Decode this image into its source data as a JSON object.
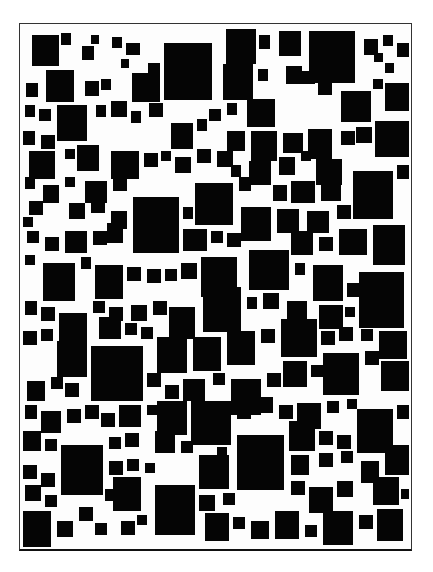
{
  "artwork": {
    "description": "Abstract composition of black squares of varying sizes packed inside a white rectangular frame",
    "background_color": "#ffffff",
    "square_color": "#050505",
    "frame": {
      "x": 19,
      "y": 23,
      "width": 393,
      "height": 528,
      "border_color": "#333333"
    },
    "squares": [
      [
        31,
        34,
        27,
        31
      ],
      [
        60,
        32,
        10,
        12
      ],
      [
        81,
        45,
        12,
        14
      ],
      [
        90,
        34,
        8,
        9
      ],
      [
        111,
        36,
        10,
        11
      ],
      [
        120,
        58,
        8,
        9
      ],
      [
        125,
        42,
        14,
        12
      ],
      [
        163,
        42,
        48,
        57
      ],
      [
        225,
        28,
        30,
        35
      ],
      [
        222,
        63,
        30,
        36
      ],
      [
        258,
        34,
        11,
        14
      ],
      [
        278,
        30,
        22,
        25
      ],
      [
        285,
        65,
        16,
        18
      ],
      [
        257,
        68,
        10,
        12
      ],
      [
        308,
        30,
        46,
        52
      ],
      [
        363,
        38,
        14,
        16
      ],
      [
        373,
        52,
        9,
        9
      ],
      [
        382,
        34,
        10,
        11
      ],
      [
        396,
        42,
        12,
        14
      ],
      [
        384,
        62,
        9,
        10
      ],
      [
        45,
        69,
        28,
        32
      ],
      [
        25,
        82,
        12,
        14
      ],
      [
        84,
        80,
        14,
        15
      ],
      [
        100,
        78,
        10,
        11
      ],
      [
        131,
        72,
        28,
        29
      ],
      [
        147,
        62,
        12,
        12
      ],
      [
        246,
        98,
        28,
        28
      ],
      [
        226,
        102,
        10,
        12
      ],
      [
        300,
        70,
        14,
        13
      ],
      [
        317,
        82,
        14,
        12
      ],
      [
        340,
        90,
        30,
        31
      ],
      [
        372,
        78,
        10,
        10
      ],
      [
        384,
        82,
        24,
        28
      ],
      [
        24,
        104,
        10,
        12
      ],
      [
        38,
        108,
        12,
        12
      ],
      [
        56,
        104,
        30,
        36
      ],
      [
        95,
        104,
        10,
        12
      ],
      [
        110,
        100,
        16,
        16
      ],
      [
        130,
        110,
        10,
        12
      ],
      [
        148,
        102,
        14,
        14
      ],
      [
        170,
        122,
        22,
        26
      ],
      [
        196,
        118,
        10,
        12
      ],
      [
        208,
        108,
        12,
        12
      ],
      [
        226,
        130,
        18,
        20
      ],
      [
        250,
        130,
        26,
        30
      ],
      [
        282,
        132,
        20,
        20
      ],
      [
        307,
        128,
        24,
        30
      ],
      [
        340,
        130,
        14,
        14
      ],
      [
        355,
        126,
        16,
        16
      ],
      [
        374,
        120,
        34,
        36
      ],
      [
        22,
        130,
        12,
        14
      ],
      [
        40,
        134,
        14,
        14
      ],
      [
        28,
        150,
        26,
        28
      ],
      [
        64,
        148,
        10,
        10
      ],
      [
        76,
        144,
        22,
        26
      ],
      [
        110,
        150,
        28,
        28
      ],
      [
        143,
        152,
        14,
        14
      ],
      [
        160,
        150,
        10,
        10
      ],
      [
        174,
        156,
        16,
        16
      ],
      [
        196,
        148,
        14,
        14
      ],
      [
        216,
        150,
        16,
        16
      ],
      [
        230,
        164,
        10,
        12
      ],
      [
        248,
        160,
        22,
        24
      ],
      [
        278,
        156,
        16,
        18
      ],
      [
        300,
        150,
        10,
        10
      ],
      [
        315,
        158,
        26,
        26
      ],
      [
        352,
        170,
        40,
        48
      ],
      [
        396,
        164,
        12,
        14
      ],
      [
        24,
        176,
        10,
        12
      ],
      [
        42,
        184,
        16,
        18
      ],
      [
        64,
        176,
        10,
        10
      ],
      [
        84,
        180,
        22,
        22
      ],
      [
        112,
        178,
        14,
        12
      ],
      [
        194,
        182,
        38,
        42
      ],
      [
        238,
        176,
        12,
        14
      ],
      [
        272,
        184,
        14,
        16
      ],
      [
        290,
        180,
        24,
        22
      ],
      [
        320,
        178,
        20,
        22
      ],
      [
        28,
        200,
        14,
        14
      ],
      [
        68,
        202,
        16,
        16
      ],
      [
        90,
        198,
        14,
        14
      ],
      [
        110,
        210,
        16,
        18
      ],
      [
        132,
        196,
        46,
        56
      ],
      [
        182,
        206,
        10,
        12
      ],
      [
        240,
        206,
        30,
        34
      ],
      [
        276,
        208,
        22,
        24
      ],
      [
        306,
        210,
        22,
        22
      ],
      [
        336,
        204,
        14,
        14
      ],
      [
        372,
        224,
        32,
        40
      ],
      [
        22,
        216,
        10,
        10
      ],
      [
        26,
        230,
        12,
        12
      ],
      [
        44,
        236,
        14,
        14
      ],
      [
        64,
        230,
        22,
        22
      ],
      [
        92,
        230,
        14,
        14
      ],
      [
        106,
        222,
        16,
        20
      ],
      [
        182,
        228,
        24,
        22
      ],
      [
        210,
        230,
        12,
        12
      ],
      [
        226,
        232,
        14,
        14
      ],
      [
        290,
        230,
        22,
        24
      ],
      [
        318,
        236,
        14,
        14
      ],
      [
        338,
        228,
        28,
        26
      ],
      [
        24,
        254,
        10,
        10
      ],
      [
        42,
        262,
        32,
        38
      ],
      [
        80,
        256,
        10,
        12
      ],
      [
        94,
        264,
        28,
        34
      ],
      [
        126,
        266,
        14,
        14
      ],
      [
        146,
        268,
        14,
        14
      ],
      [
        164,
        268,
        12,
        12
      ],
      [
        180,
        262,
        16,
        16
      ],
      [
        200,
        256,
        36,
        40
      ],
      [
        248,
        249,
        40,
        40
      ],
      [
        294,
        262,
        10,
        12
      ],
      [
        312,
        264,
        30,
        36
      ],
      [
        346,
        282,
        14,
        14
      ],
      [
        358,
        271,
        45,
        56
      ],
      [
        24,
        300,
        12,
        14
      ],
      [
        40,
        306,
        14,
        14
      ],
      [
        58,
        312,
        28,
        36
      ],
      [
        92,
        300,
        12,
        12
      ],
      [
        108,
        306,
        14,
        14
      ],
      [
        130,
        304,
        16,
        16
      ],
      [
        152,
        300,
        14,
        14
      ],
      [
        168,
        306,
        26,
        32
      ],
      [
        202,
        286,
        38,
        45
      ],
      [
        246,
        296,
        10,
        12
      ],
      [
        262,
        292,
        16,
        16
      ],
      [
        286,
        300,
        20,
        22
      ],
      [
        318,
        304,
        24,
        24
      ],
      [
        344,
        306,
        10,
        10
      ],
      [
        22,
        330,
        14,
        14
      ],
      [
        40,
        328,
        12,
        12
      ],
      [
        56,
        340,
        30,
        36
      ],
      [
        98,
        316,
        22,
        22
      ],
      [
        124,
        322,
        12,
        12
      ],
      [
        140,
        326,
        12,
        12
      ],
      [
        156,
        336,
        30,
        36
      ],
      [
        192,
        336,
        28,
        34
      ],
      [
        226,
        330,
        28,
        34
      ],
      [
        260,
        328,
        14,
        14
      ],
      [
        280,
        318,
        36,
        38
      ],
      [
        320,
        330,
        14,
        14
      ],
      [
        338,
        326,
        14,
        14
      ],
      [
        360,
        328,
        12,
        12
      ],
      [
        378,
        330,
        28,
        28
      ],
      [
        90,
        345,
        52,
        55
      ],
      [
        26,
        380,
        18,
        20
      ],
      [
        50,
        376,
        12,
        12
      ],
      [
        64,
        382,
        14,
        14
      ],
      [
        146,
        372,
        14,
        14
      ],
      [
        164,
        384,
        14,
        14
      ],
      [
        182,
        378,
        22,
        22
      ],
      [
        212,
        372,
        12,
        12
      ],
      [
        230,
        378,
        30,
        36
      ],
      [
        266,
        372,
        14,
        14
      ],
      [
        282,
        360,
        24,
        26
      ],
      [
        310,
        364,
        12,
        12
      ],
      [
        322,
        352,
        36,
        42
      ],
      [
        364,
        350,
        14,
        14
      ],
      [
        380,
        360,
        28,
        30
      ],
      [
        24,
        404,
        12,
        14
      ],
      [
        40,
        410,
        20,
        22
      ],
      [
        66,
        408,
        14,
        14
      ],
      [
        84,
        404,
        14,
        14
      ],
      [
        100,
        412,
        14,
        14
      ],
      [
        118,
        404,
        22,
        22
      ],
      [
        146,
        404,
        10,
        10
      ],
      [
        156,
        400,
        30,
        34
      ],
      [
        190,
        400,
        40,
        44
      ],
      [
        236,
        404,
        14,
        14
      ],
      [
        256,
        396,
        16,
        16
      ],
      [
        278,
        404,
        14,
        14
      ],
      [
        296,
        402,
        24,
        26
      ],
      [
        326,
        400,
        12,
        12
      ],
      [
        346,
        398,
        10,
        10
      ],
      [
        356,
        408,
        36,
        44
      ],
      [
        396,
        404,
        12,
        14
      ],
      [
        22,
        430,
        18,
        20
      ],
      [
        44,
        438,
        12,
        12
      ],
      [
        60,
        444,
        42,
        50
      ],
      [
        108,
        436,
        12,
        12
      ],
      [
        124,
        432,
        14,
        14
      ],
      [
        154,
        430,
        20,
        22
      ],
      [
        180,
        440,
        12,
        12
      ],
      [
        236,
        434,
        47,
        55
      ],
      [
        288,
        420,
        26,
        30
      ],
      [
        318,
        430,
        14,
        14
      ],
      [
        336,
        434,
        14,
        14
      ],
      [
        290,
        454,
        18,
        20
      ],
      [
        318,
        452,
        14,
        14
      ],
      [
        340,
        450,
        12,
        12
      ],
      [
        360,
        460,
        18,
        22
      ],
      [
        384,
        444,
        24,
        30
      ],
      [
        22,
        464,
        14,
        14
      ],
      [
        40,
        472,
        14,
        14
      ],
      [
        108,
        460,
        14,
        14
      ],
      [
        126,
        458,
        12,
        12
      ],
      [
        144,
        462,
        10,
        10
      ],
      [
        198,
        454,
        30,
        34
      ],
      [
        216,
        446,
        10,
        10
      ],
      [
        24,
        484,
        16,
        16
      ],
      [
        44,
        494,
        12,
        12
      ],
      [
        104,
        488,
        12,
        12
      ],
      [
        112,
        476,
        28,
        34
      ],
      [
        154,
        484,
        40,
        50
      ],
      [
        198,
        494,
        16,
        16
      ],
      [
        222,
        492,
        12,
        12
      ],
      [
        290,
        480,
        14,
        14
      ],
      [
        308,
        486,
        24,
        26
      ],
      [
        336,
        480,
        16,
        16
      ],
      [
        372,
        476,
        26,
        28
      ],
      [
        400,
        488,
        8,
        10
      ],
      [
        22,
        510,
        28,
        36
      ],
      [
        56,
        520,
        16,
        16
      ],
      [
        78,
        506,
        14,
        14
      ],
      [
        94,
        522,
        12,
        12
      ],
      [
        120,
        520,
        14,
        14
      ],
      [
        136,
        514,
        10,
        10
      ],
      [
        204,
        512,
        24,
        28
      ],
      [
        232,
        516,
        12,
        12
      ],
      [
        250,
        520,
        18,
        18
      ],
      [
        274,
        510,
        24,
        28
      ],
      [
        304,
        524,
        12,
        12
      ],
      [
        322,
        510,
        30,
        34
      ],
      [
        358,
        514,
        14,
        14
      ],
      [
        376,
        508,
        26,
        32
      ]
    ]
  }
}
